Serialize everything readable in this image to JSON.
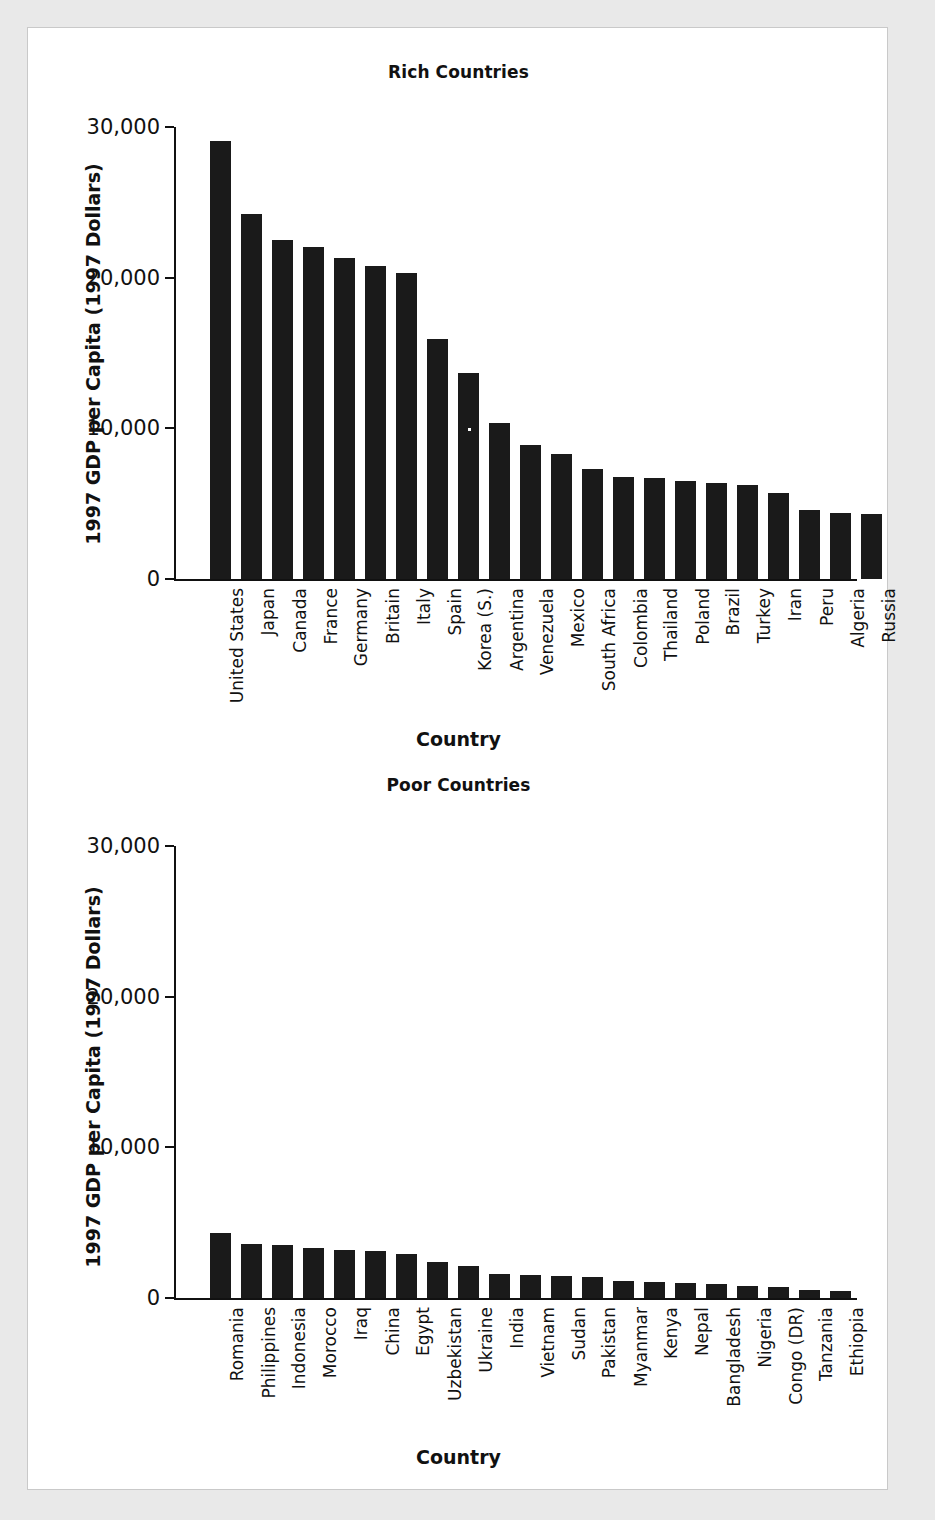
{
  "page": {
    "background_color": "#e9e9e9",
    "panel_color": "#ffffff",
    "panel_border_color": "#c9c9c9",
    "bar_color": "#1a1a1a",
    "axis_color": "#111111"
  },
  "chart_data": [
    {
      "type": "bar",
      "title": "Rich Countries",
      "xlabel": "Country",
      "ylabel": "1997 GDP per Capita (1997 Dollars)",
      "ylim": [
        0,
        30000
      ],
      "yticks": [
        0,
        10000,
        20000,
        30000
      ],
      "ytick_labels": [
        "0",
        "10,000",
        "20,000",
        "30,000"
      ],
      "grid": false,
      "legend": "none",
      "categories": [
        "United States",
        "Japan",
        "Canada",
        "France",
        "Germany",
        "Britain",
        "Italy",
        "Spain",
        "Korea (S.)",
        "Argentina",
        "Venezuela",
        "Mexico",
        "South Africa",
        "Colombia",
        "Thailand",
        "Poland",
        "Brazil",
        "Turkey",
        "Iran",
        "Peru",
        "Algeria",
        "Russia"
      ],
      "values": [
        29080,
        24200,
        22500,
        22050,
        21300,
        20750,
        20300,
        15950,
        13700,
        10350,
        8900,
        8300,
        7300,
        6800,
        6700,
        6500,
        6400,
        6250,
        5700,
        4600,
        4400,
        4300
      ]
    },
    {
      "type": "bar",
      "title": "Poor Countries",
      "xlabel": "Country",
      "ylabel": "1997 GDP per Capita (1997 Dollars)",
      "ylim": [
        0,
        30000
      ],
      "yticks": [
        0,
        10000,
        20000,
        30000
      ],
      "ytick_labels": [
        "0",
        "10,000",
        "20,000",
        "30,000"
      ],
      "grid": false,
      "legend": "none",
      "categories": [
        "Romania",
        "Philippines",
        "Indonesia",
        "Morocco",
        "Iraq",
        "China",
        "Egypt",
        "Uzbekistan",
        "Ukraine",
        "India",
        "Vietnam",
        "Sudan",
        "Pakistan",
        "Myanmar",
        "Kenya",
        "Nepal",
        "Bangladesh",
        "Nigeria",
        "Congo (DR)",
        "Tanzania",
        "Ethiopia"
      ],
      "values": [
        4300,
        3600,
        3500,
        3300,
        3200,
        3100,
        2950,
        2400,
        2100,
        1600,
        1550,
        1450,
        1400,
        1100,
        1050,
        1000,
        900,
        800,
        750,
        550,
        450
      ]
    }
  ]
}
